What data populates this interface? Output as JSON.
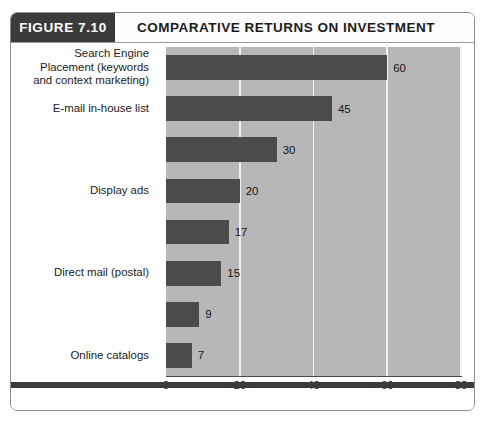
{
  "figure": {
    "number_label": "FIGURE 7.10",
    "title": "COMPARATIVE RETURNS ON INVESTMENT",
    "caption_fragment": ""
  },
  "colors": {
    "header_block": "#3b3b3b",
    "bar": "#4b4b4b",
    "plot_background": "#b7b7b7",
    "gridline": "#f2f2f2",
    "frame_border": "#8d8d8d"
  },
  "chart_data": {
    "type": "bar",
    "orientation": "horizontal",
    "title": "COMPARATIVE RETURNS ON INVESTMENT",
    "xlabel": "",
    "ylabel": "",
    "xlim": [
      0,
      80
    ],
    "xticks": [
      0,
      20,
      40,
      60,
      80
    ],
    "grid": true,
    "legend": null,
    "categories": [
      "Search Engine\nPlacement (keywords\nand context marketing)",
      "E-mail in-house list",
      "",
      "Display ads",
      "",
      "Direct mail (postal)",
      "",
      "Online catalogs"
    ],
    "values": [
      60,
      45,
      30,
      20,
      17,
      15,
      9,
      7
    ],
    "data_labels": [
      "60",
      "45",
      "30",
      "20",
      "17",
      "15",
      "9",
      "7"
    ]
  }
}
